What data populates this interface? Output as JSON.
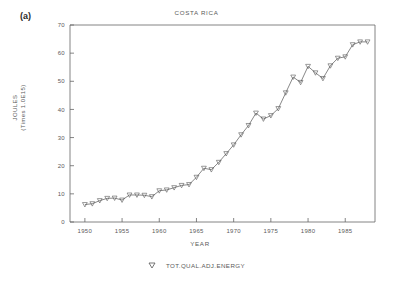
{
  "figure": {
    "panel_label": "(a)",
    "background": "#ffffff",
    "line_color": "#555555",
    "axis_color": "#666666",
    "text_color": "#5a5a5a"
  },
  "chart_data": {
    "type": "line",
    "title": "COSTA RICA",
    "xlabel": "YEAR",
    "ylabel_line1": "JOULES",
    "ylabel_line2": "(Times 1.0E15)",
    "xlim": [
      1948,
      1989
    ],
    "ylim": [
      0,
      70
    ],
    "xticks": [
      1950,
      1955,
      1960,
      1965,
      1970,
      1975,
      1980,
      1985
    ],
    "yticks": [
      0,
      10,
      20,
      30,
      40,
      50,
      60,
      70
    ],
    "xtick_labels": [
      "1950",
      "1955",
      "1960",
      "1965",
      "1970",
      "1975",
      "1980",
      "1985"
    ],
    "ytick_labels": [
      "0",
      "10",
      "20",
      "30",
      "40",
      "50",
      "60",
      "70"
    ],
    "grid": false,
    "legend_position": "below",
    "marker": "triangle-down",
    "series": [
      {
        "name": "TOT.QUAL.ADJ.ENERGY",
        "x": [
          1950,
          1951,
          1952,
          1953,
          1954,
          1955,
          1956,
          1957,
          1958,
          1959,
          1960,
          1961,
          1962,
          1963,
          1964,
          1965,
          1966,
          1967,
          1968,
          1969,
          1970,
          1971,
          1972,
          1973,
          1974,
          1975,
          1976,
          1977,
          1978,
          1979,
          1980,
          1981,
          1982,
          1983,
          1984,
          1985,
          1986,
          1987,
          1988
        ],
        "values": [
          6.2,
          6.5,
          7.6,
          8.4,
          8.5,
          7.8,
          9.6,
          9.6,
          9.5,
          9.0,
          11.1,
          11.4,
          12.2,
          13.0,
          13.3,
          15.9,
          19.1,
          18.6,
          21.2,
          24.3,
          27.4,
          31.0,
          34.3,
          38.7,
          36.6,
          37.8,
          40.3,
          45.9,
          51.5,
          49.6,
          55.3,
          53.0,
          51.0,
          55.5,
          58.2,
          58.7,
          63.0,
          64.0,
          64.0
        ]
      }
    ]
  }
}
